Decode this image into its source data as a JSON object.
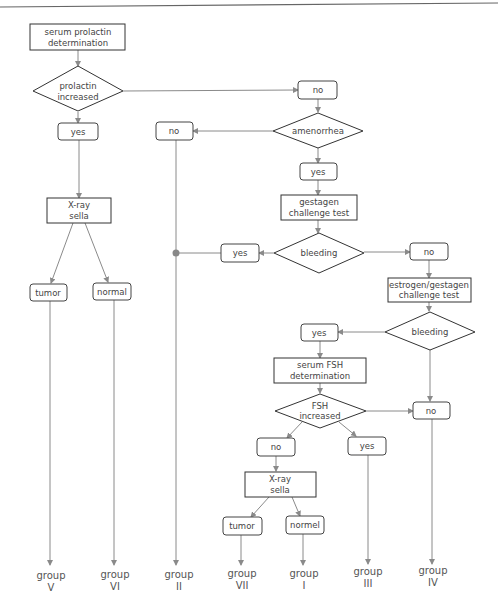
{
  "nodes": {
    "serum_prolactin": [
      "serum prolactin",
      "determination"
    ],
    "prolactin_increased": [
      "prolactin",
      "increased"
    ],
    "yes_prolactin": "yes",
    "no_prolactin": "no",
    "amenorrhea": "amenorrhea",
    "no_amenorrhea": "no",
    "yes_amenorrhea": "yes",
    "gestagen_test": [
      "gestagen",
      "challenge test"
    ],
    "bleeding_1": "bleeding",
    "yes_bleeding_1": "yes",
    "no_bleeding_1": "no",
    "estrogen_gestagen_test": [
      "estrogen/gestagen",
      "challenge test"
    ],
    "bleeding_2": "bleeding",
    "yes_bleeding_2": "yes",
    "no_bleeding_2": "no",
    "serum_fsh": [
      "serum FSH",
      "determination"
    ],
    "fsh_increased": [
      "FSH",
      "increased"
    ],
    "no_fsh": "no",
    "yes_fsh": "yes",
    "xray_sella_1": [
      "X-ray",
      "sella"
    ],
    "tumor_1": "tumor",
    "normal_1": "normal",
    "xray_sella_2": [
      "X-ray",
      "sella"
    ],
    "tumor_2": "tumor",
    "normal_2": "normel"
  },
  "groups": [
    [
      "group",
      "V"
    ],
    [
      "group",
      "VI"
    ],
    [
      "group",
      "II"
    ],
    [
      "group",
      "VII"
    ],
    [
      "group",
      "I"
    ],
    [
      "group",
      "III"
    ],
    [
      "group",
      "IV"
    ]
  ],
  "colors": {
    "line": "#8a8a8a",
    "border": "#333333",
    "text": "#444444"
  }
}
